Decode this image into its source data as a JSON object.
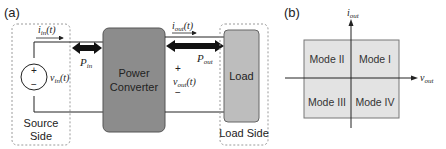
{
  "panel_a": {
    "label": "(a)",
    "source_side": {
      "label_line1": "Source",
      "label_line2": "Side",
      "plus": "+",
      "minus": "−",
      "voltage_label_base": "v",
      "voltage_label_sub": "in",
      "voltage_label_arg": "(t)"
    },
    "input_current": {
      "base": "i",
      "sub": "in",
      "arg": "(t)"
    },
    "input_power": {
      "base": "P",
      "sub": "in"
    },
    "converter": {
      "line1": "Power",
      "line2": "Converter"
    },
    "output_current": {
      "base": "i",
      "sub": "out",
      "arg": "(t)"
    },
    "output_power": {
      "base": "P",
      "sub": "out"
    },
    "output_voltage": {
      "plus": "+",
      "minus": "−",
      "base": "v",
      "sub": "out",
      "arg": "(t)"
    },
    "load": {
      "label": "Load"
    },
    "load_side": {
      "label": "Load Side"
    }
  },
  "panel_b": {
    "label": "(b)",
    "y_axis": {
      "base": "i",
      "sub": "out"
    },
    "x_axis": {
      "base": "v",
      "sub": "out"
    },
    "quadrants": {
      "q1": "Mode I",
      "q2": "Mode II",
      "q3": "Mode III",
      "q4": "Mode IV"
    }
  },
  "colors": {
    "converter_fill": "#8c8c8c",
    "load_fill": "#bdbdbd",
    "quadrant_fill": "#e3e3e3",
    "dashed_border": "#9a9a9a",
    "stroke": "#222222"
  }
}
